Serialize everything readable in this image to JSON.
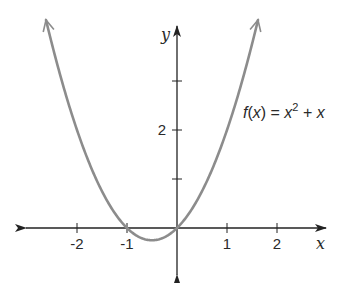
{
  "chart_data": {
    "type": "line",
    "title": "",
    "function_label": "f(x) = x² + x",
    "function_parts": {
      "f": "f",
      "open": "(",
      "x": "x",
      "close": ")",
      "eq": " = ",
      "base": "x",
      "exp": "2",
      "plus": " + ",
      "last": "x"
    },
    "xlabel": "x",
    "ylabel": "y",
    "xlim": [
      -3,
      3
    ],
    "ylim": [
      -0.9,
      4.2
    ],
    "x_ticks": [
      -2,
      -1,
      1,
      2
    ],
    "x_tick_labels": [
      "-2",
      "-1",
      "1",
      "2"
    ],
    "y_ticks": [
      1,
      2,
      3
    ],
    "y_tick_labels": [
      "",
      "2",
      ""
    ],
    "grid": false,
    "legend": null,
    "series": [
      {
        "name": "f(x) = x^2 + x",
        "color": "#8c8c8c",
        "x": [
          -2.62,
          -2.5,
          -2.0,
          -1.5,
          -1.0,
          -0.75,
          -0.5,
          -0.25,
          0.0,
          0.5,
          1.0,
          1.5,
          1.62
        ],
        "values": [
          4.24,
          3.75,
          2.0,
          0.75,
          0.0,
          -0.1875,
          -0.25,
          -0.1875,
          0.0,
          0.75,
          2.0,
          3.75,
          4.24
        ]
      }
    ],
    "annotations": [
      {
        "text": "f(x) = x² + x",
        "x": 1.2,
        "y": 2.7
      }
    ],
    "colors": {
      "curve": "#8c8c8c",
      "axis": "#222222",
      "text": "#2a2a2a"
    }
  }
}
